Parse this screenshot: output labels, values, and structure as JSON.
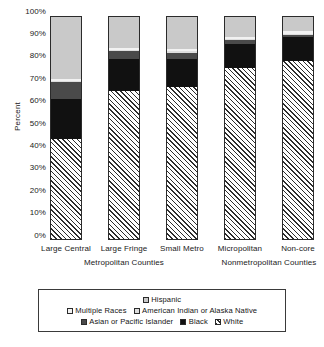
{
  "chart_data": {
    "type": "bar",
    "stacked": true,
    "title": "",
    "xlabel": "",
    "ylabel": "Percent",
    "ylim": [
      0,
      100
    ],
    "ytick_labels": [
      "100%",
      "90%",
      "80%",
      "70%",
      "60%",
      "50%",
      "40%",
      "30%",
      "20%",
      "10%",
      "0%"
    ],
    "ytick_values": [
      100,
      90,
      80,
      70,
      60,
      50,
      40,
      30,
      20,
      10,
      0
    ],
    "grid": false,
    "legend_position": "bottom",
    "categories": [
      "Large Central",
      "Large Fringe",
      "Small Metro",
      "Micropolitan",
      "Non-core"
    ],
    "group_labels": [
      "Metropolitan Counties",
      "Nonmetropolitan Counties"
    ],
    "series": [
      {
        "name": "Hispanic",
        "color": "#c9c9c9",
        "values": [
          28,
          14,
          14.5,
          9,
          6.5
        ]
      },
      {
        "name": "Multiple Races",
        "color": "#f2f2f2",
        "values": [
          1,
          1,
          1,
          1,
          1
        ]
      },
      {
        "name": "American Indian or Alaska Native",
        "color": "#dedede",
        "values": [
          0.5,
          0.5,
          0.5,
          0.5,
          0.5
        ]
      },
      {
        "name": "Asian or Pacific Islander",
        "color": "#4a4a4a",
        "values": [
          7.5,
          3.5,
          3,
          1.5,
          1
        ]
      },
      {
        "name": "Black",
        "color": "#111111",
        "values": [
          18,
          14.5,
          12.5,
          11,
          11
        ]
      },
      {
        "name": "White",
        "color": "#f4f4f4",
        "values": [
          45,
          66.5,
          68.5,
          77,
          80
        ]
      }
    ]
  },
  "axis": {
    "y_title": "Percent"
  },
  "legend": {
    "rows": [
      [
        "Hispanic"
      ],
      [
        "Multiple Races",
        "American Indian or Alaska Native"
      ],
      [
        "Asian or Pacific Islander",
        "Black",
        "White"
      ]
    ]
  }
}
